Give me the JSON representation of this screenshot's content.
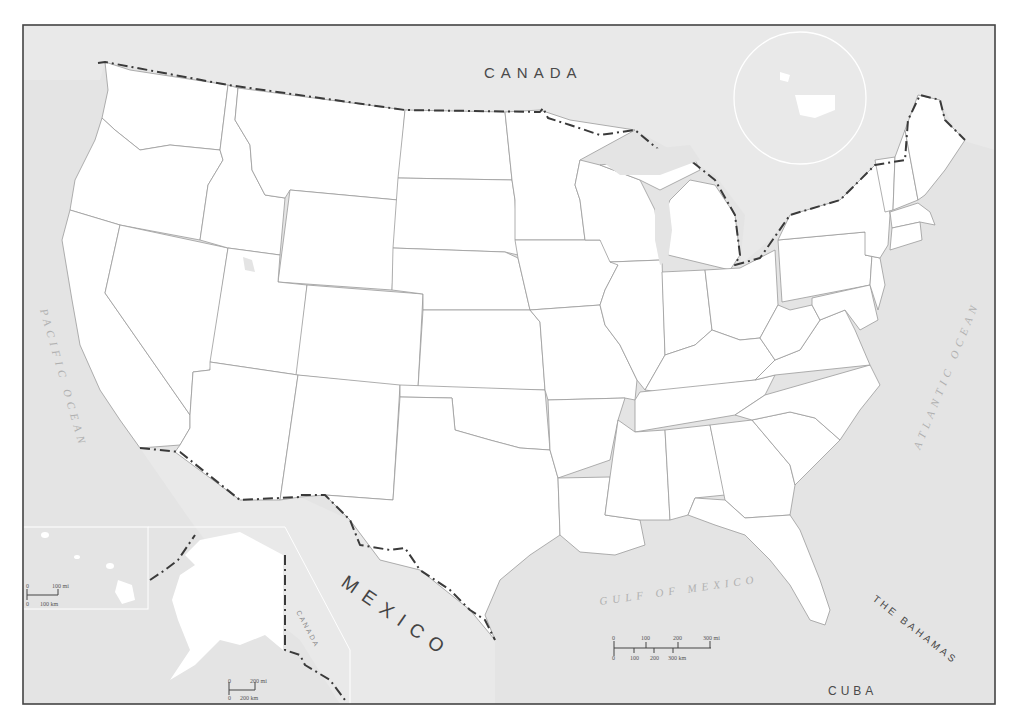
{
  "map": {
    "title": "United States outline map",
    "colors": {
      "water": "#e4e4e4",
      "land": "#ffffff",
      "state_border": "#9a9a9a",
      "international_border": "#3a3a3a",
      "frame": "#444444"
    },
    "labels": {
      "canada": "CANADA",
      "mexico": "MEXICO",
      "pacific_ocean": "PACIFIC OCEAN",
      "atlantic_ocean": "ATLANTIC OCEAN",
      "gulf_of_mexico": "GULF OF MEXICO",
      "the_bahamas": "THE BAHAMAS",
      "cuba": "CUBA",
      "alaska_canada": "CANADA"
    },
    "main_scale_bar": {
      "mi_ticks": [
        "0",
        "100",
        "200",
        "300 mi"
      ],
      "km_ticks": [
        "0",
        "100",
        "200",
        "300 km"
      ]
    },
    "hawaii_inset": {
      "scale_mi": [
        "0",
        "100 mi"
      ],
      "scale_km": [
        "0",
        "100 km"
      ]
    },
    "alaska_inset": {
      "scale_mi": [
        "0",
        "200 mi"
      ],
      "scale_km": [
        "0",
        "200 km"
      ]
    },
    "locator_globe": "globe-locator-icon"
  }
}
